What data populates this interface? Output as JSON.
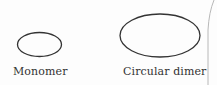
{
  "figure": {
    "items": [
      {
        "label": "Monomer",
        "shape": "ellipse",
        "size": "small",
        "cx": 39.5,
        "cy": 44.5,
        "rx": 22,
        "ry": 12
      },
      {
        "label": "Circular dimer",
        "shape": "ellipse",
        "size": "large",
        "cx": 160,
        "cy": 35.5,
        "rx": 40,
        "ry": 21.5
      }
    ],
    "stroke_color": "#333333",
    "edge_line_color": "#b8b8b8"
  }
}
